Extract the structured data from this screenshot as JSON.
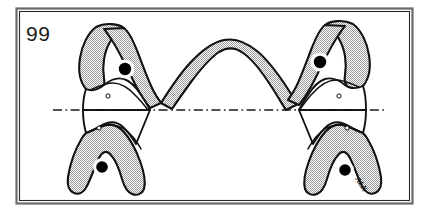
{
  "figure": {
    "number_label": "99",
    "signature": "ALK",
    "caption": "",
    "frame": {
      "border_color": "#5a5a5a",
      "inner_border_color": "#2a2a2a",
      "background": "#ffffff"
    },
    "palette": {
      "outline": "#111111",
      "hatch_gray": "#a8a8a8",
      "hatch_background": "#ffffff",
      "white_fill": "#ffffff",
      "marker_black": "#000000",
      "reference_line": "#1a1a1a",
      "page_background": "#ffffff"
    },
    "elements": {
      "reference_line_label": "horizontal dash-dot reference axis",
      "arch_label": "central hatched arch",
      "left_superior_process_label": "left superior process",
      "right_superior_process_label": "right superior process",
      "left_inferior_process_label": "left inferior process",
      "right_inferior_process_label": "right inferior process",
      "left_body_label": "left central body",
      "right_body_label": "right central body"
    },
    "markers": {
      "solid_dots": [
        {
          "name": "left-upper-dot",
          "cx": 125,
          "cy": 69,
          "r": 6.2
        },
        {
          "name": "right-upper-dot",
          "cx": 320,
          "cy": 62,
          "r": 6.2
        },
        {
          "name": "left-lower-dot",
          "cx": 102,
          "cy": 167,
          "r": 5.8
        },
        {
          "name": "right-lower-dot",
          "cx": 345,
          "cy": 170,
          "r": 5.8
        }
      ],
      "open_circles": [
        {
          "name": "left-upper-foramen",
          "cx": 108,
          "cy": 96,
          "r": 2.1
        },
        {
          "name": "right-upper-foramen",
          "cx": 339,
          "cy": 96,
          "r": 2.1
        },
        {
          "name": "left-lower-foramen",
          "cx": 99,
          "cy": 128,
          "r": 2.1
        },
        {
          "name": "right-lower-foramen",
          "cx": 347,
          "cy": 128,
          "r": 2.1
        }
      ]
    },
    "reference_line": {
      "x_start": 53,
      "x_end": 387,
      "y": 110,
      "style": "dash-dot"
    }
  }
}
